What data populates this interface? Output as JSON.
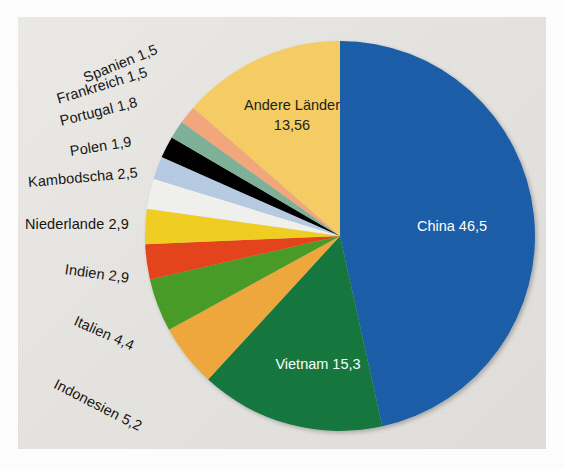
{
  "figure": {
    "background_color": "#ffffff",
    "panel_color": "#e6e4e0"
  },
  "chart_data": {
    "type": "pie",
    "title": "",
    "subtitle": "",
    "xlabel": "",
    "ylabel": "",
    "legend_position": "none",
    "grid": false,
    "units": "percent",
    "decimal_separator": ",",
    "start_angle_deg": 0,
    "direction": "clockwise",
    "categories": [
      "China",
      "Vietnam",
      "Indonesien",
      "Italien",
      "Indien",
      "Niederlande",
      "Kambodscha",
      "Polen",
      "Portugal",
      "Frankreich",
      "Spanien",
      "Andere Länder"
    ],
    "values": [
      46.5,
      15.3,
      5.2,
      4.4,
      2.9,
      2.9,
      2.5,
      1.9,
      1.8,
      1.5,
      1.5,
      13.56
    ],
    "value_labels": [
      "46,5",
      "15,3",
      "5,2",
      "4,4",
      "2,9",
      "2,9",
      "2,5",
      "1,9",
      "1,8",
      "1,5",
      "1,5",
      "13,56"
    ],
    "colors": [
      "#1a5eaa",
      "#17793f",
      "#f0a93c",
      "#4a9e28",
      "#e8441a",
      "#f2d024",
      "#f2f2ee",
      "#b8cce4",
      "#000000",
      "#7fb39a",
      "#f4a97c",
      "#f7cf63"
    ],
    "slices": [
      {
        "name": "China",
        "value": 46.5,
        "value_label": "46,5",
        "label": "China 46,5",
        "color": "#1a5eaa",
        "label_placement": "inside"
      },
      {
        "name": "Vietnam",
        "value": 15.3,
        "value_label": "15,3",
        "label": "Vietnam 15,3",
        "color": "#17793f",
        "label_placement": "inside"
      },
      {
        "name": "Indonesien",
        "value": 5.2,
        "value_label": "5,2",
        "label": "Indonesien 5,2",
        "color": "#f0a93c",
        "label_placement": "outside"
      },
      {
        "name": "Italien",
        "value": 4.4,
        "value_label": "4,4",
        "label": "Italien 4,4",
        "color": "#4a9e28",
        "label_placement": "outside"
      },
      {
        "name": "Indien",
        "value": 2.9,
        "value_label": "2,9",
        "label": "Indien 2,9",
        "color": "#e8441a",
        "label_placement": "outside"
      },
      {
        "name": "Niederlande",
        "value": 2.9,
        "value_label": "2,9",
        "label": "Niederlande 2,9",
        "color": "#f2d024",
        "label_placement": "outside"
      },
      {
        "name": "Kambodscha",
        "value": 2.5,
        "value_label": "2,5",
        "label": "Kambodscha 2,5",
        "color": "#f2f2ee",
        "label_placement": "outside"
      },
      {
        "name": "Polen",
        "value": 1.9,
        "value_label": "1,9",
        "label": "Polen 1,9",
        "color": "#b8cce4",
        "label_placement": "outside"
      },
      {
        "name": "Portugal",
        "value": 1.8,
        "value_label": "1,8",
        "label": "Portugal 1,8",
        "color": "#000000",
        "label_placement": "outside"
      },
      {
        "name": "Frankreich",
        "value": 1.5,
        "value_label": "1,5",
        "label": "Frankreich 1,5",
        "color": "#7fb39a",
        "label_placement": "outside"
      },
      {
        "name": "Spanien",
        "value": 1.5,
        "value_label": "1,5",
        "label": "Spanien 1,5",
        "color": "#f4a97c",
        "label_placement": "outside"
      },
      {
        "name": "Andere Länder",
        "value": 13.56,
        "value_label": "13,56",
        "label": "Andere Länder 13,56",
        "color": "#f7cf63",
        "label_placement": "inside"
      }
    ]
  },
  "labels": {
    "china": "China 46,5",
    "vietnam": "Vietnam 15,3",
    "andere_laender_line1": "Andere Länder",
    "andere_laender_line2": "13,56",
    "indonesien": "Indonesien 5,2",
    "italien": "Italien 4,4",
    "indien": "Indien 2,9",
    "niederlande": "Niederlande 2,9",
    "kambodscha": "Kambodscha 2,5",
    "polen": "Polen 1,9",
    "portugal": "Portugal 1,8",
    "frankreich": "Frankreich 1,5",
    "spanien": "Spanien 1,5"
  }
}
